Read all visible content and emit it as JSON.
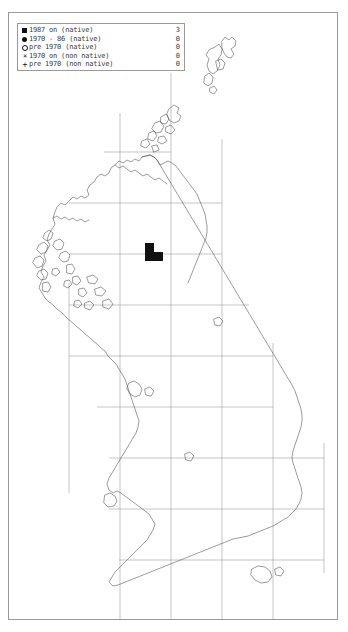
{
  "map": {
    "title": "UK and Ireland species distribution map",
    "region": "British Isles",
    "projection": "OSGB national grid",
    "grid": {
      "visible": true,
      "line_color": "#8b8b8b",
      "cell_size_px": 51,
      "vertical_lines_x": [
        18,
        69,
        120,
        171,
        222,
        273,
        324
      ],
      "horizontal_lines_y": [
        40,
        91,
        142,
        193,
        244,
        295,
        346,
        397,
        448,
        499,
        550,
        601
      ]
    },
    "frame": {
      "border_color": "#9a9a9a",
      "background": "#ffffff"
    }
  },
  "legend": {
    "border_color": "#9a9a9a",
    "text_color": "#3b3b3b",
    "rows": [
      {
        "symbol": "filled-square",
        "label": "1987 on (native)",
        "count": "3"
      },
      {
        "symbol": "filled-circle",
        "label": "1970 - 86 (native)",
        "count": "0"
      },
      {
        "symbol": "open-circle",
        "label": "pre 1970 (native)",
        "count": "0"
      },
      {
        "symbol": "cross-x",
        "label": "1970 on (non native)",
        "count": "0"
      },
      {
        "symbol": "plus",
        "label": "pre 1970 (non native)",
        "count": "0"
      }
    ]
  },
  "records": {
    "marker_color": "#111111",
    "marker_class": "1987 on (native)",
    "total": "3",
    "squares": [
      {
        "x": 145,
        "y": 243,
        "size": 9
      },
      {
        "x": 145,
        "y": 252,
        "size": 9
      },
      {
        "x": 154,
        "y": 252,
        "size": 9
      }
    ]
  }
}
